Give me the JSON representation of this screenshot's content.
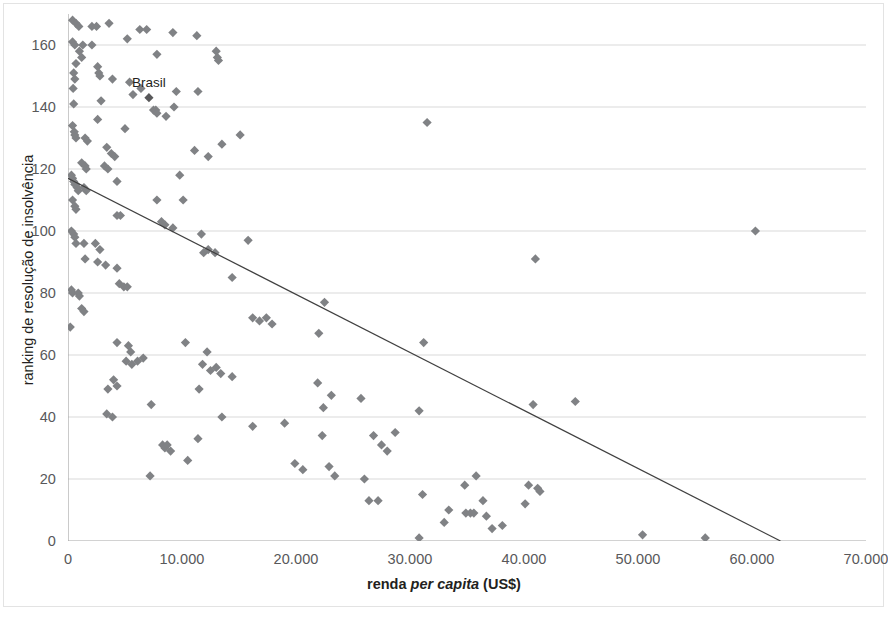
{
  "chart_data": {
    "type": "scatter",
    "title": "",
    "xlabel_parts": {
      "pre": "renda ",
      "italic": "per capita",
      "post": " (US$)"
    },
    "xlabel": "renda per capita (US$)",
    "ylabel": "ranking de resolução de insolvência",
    "xlim": [
      0,
      70000
    ],
    "ylim": [
      0,
      170
    ],
    "x_ticks": [
      0,
      10000,
      20000,
      30000,
      40000,
      50000,
      60000,
      70000
    ],
    "x_tick_labels": [
      "0",
      "10.000",
      "20.000",
      "30.000",
      "40.000",
      "50.000",
      "60.000",
      "70.000"
    ],
    "y_ticks": [
      0,
      20,
      40,
      60,
      80,
      100,
      120,
      140,
      160
    ],
    "y_tick_labels": [
      "0",
      "20",
      "40",
      "60",
      "80",
      "100",
      "120",
      "140",
      "160"
    ],
    "grid": "horizontal",
    "legend": "none",
    "marker": {
      "shape": "diamond",
      "size": 8,
      "color": "#808285"
    },
    "highlight_marker": {
      "color": "#58585a"
    },
    "trendline": {
      "type": "linear",
      "color": "#404040",
      "width": 1.2,
      "x_start": 0,
      "y_start": 117,
      "x_end": 62500,
      "y_end": 0
    },
    "annotations": [
      {
        "label": "Brasil",
        "x": 7100,
        "y": 143
      }
    ],
    "points": [
      {
        "x": 400,
        "y": 168
      },
      {
        "x": 700,
        "y": 167
      },
      {
        "x": 950,
        "y": 166
      },
      {
        "x": 2100,
        "y": 166
      },
      {
        "x": 2500,
        "y": 166
      },
      {
        "x": 3600,
        "y": 167
      },
      {
        "x": 6300,
        "y": 165
      },
      {
        "x": 6900,
        "y": 165
      },
      {
        "x": 9200,
        "y": 164
      },
      {
        "x": 400,
        "y": 161
      },
      {
        "x": 600,
        "y": 160
      },
      {
        "x": 1300,
        "y": 160
      },
      {
        "x": 2100,
        "y": 160
      },
      {
        "x": 5200,
        "y": 162
      },
      {
        "x": 11300,
        "y": 163
      },
      {
        "x": 1000,
        "y": 158
      },
      {
        "x": 1200,
        "y": 156
      },
      {
        "x": 7800,
        "y": 157
      },
      {
        "x": 13000,
        "y": 158
      },
      {
        "x": 13100,
        "y": 156
      },
      {
        "x": 13200,
        "y": 155
      },
      {
        "x": 700,
        "y": 154
      },
      {
        "x": 2600,
        "y": 153
      },
      {
        "x": 2700,
        "y": 151
      },
      {
        "x": 2800,
        "y": 150
      },
      {
        "x": 500,
        "y": 151
      },
      {
        "x": 600,
        "y": 149
      },
      {
        "x": 3900,
        "y": 149
      },
      {
        "x": 5400,
        "y": 148
      },
      {
        "x": 450,
        "y": 146
      },
      {
        "x": 6400,
        "y": 146
      },
      {
        "x": 7100,
        "y": 143,
        "highlight": true
      },
      {
        "x": 11400,
        "y": 145
      },
      {
        "x": 9500,
        "y": 145
      },
      {
        "x": 500,
        "y": 141
      },
      {
        "x": 2900,
        "y": 142
      },
      {
        "x": 5700,
        "y": 144
      },
      {
        "x": 7500,
        "y": 139
      },
      {
        "x": 7700,
        "y": 139
      },
      {
        "x": 7800,
        "y": 138
      },
      {
        "x": 9300,
        "y": 140
      },
      {
        "x": 8600,
        "y": 137
      },
      {
        "x": 2600,
        "y": 136
      },
      {
        "x": 400,
        "y": 134
      },
      {
        "x": 550,
        "y": 132
      },
      {
        "x": 600,
        "y": 131
      },
      {
        "x": 700,
        "y": 130
      },
      {
        "x": 1500,
        "y": 130
      },
      {
        "x": 1700,
        "y": 129
      },
      {
        "x": 5000,
        "y": 133
      },
      {
        "x": 11100,
        "y": 126
      },
      {
        "x": 12300,
        "y": 124
      },
      {
        "x": 13500,
        "y": 128
      },
      {
        "x": 15100,
        "y": 131
      },
      {
        "x": 3400,
        "y": 127
      },
      {
        "x": 3800,
        "y": 125
      },
      {
        "x": 4100,
        "y": 124
      },
      {
        "x": 1200,
        "y": 122
      },
      {
        "x": 1500,
        "y": 121
      },
      {
        "x": 1600,
        "y": 120
      },
      {
        "x": 3200,
        "y": 121
      },
      {
        "x": 3500,
        "y": 120
      },
      {
        "x": 9800,
        "y": 118
      },
      {
        "x": 300,
        "y": 118
      },
      {
        "x": 400,
        "y": 117
      },
      {
        "x": 500,
        "y": 116
      },
      {
        "x": 600,
        "y": 115
      },
      {
        "x": 700,
        "y": 115
      },
      {
        "x": 800,
        "y": 114
      },
      {
        "x": 900,
        "y": 113
      },
      {
        "x": 1400,
        "y": 114
      },
      {
        "x": 1600,
        "y": 113
      },
      {
        "x": 4300,
        "y": 116
      },
      {
        "x": 7800,
        "y": 110
      },
      {
        "x": 10100,
        "y": 110
      },
      {
        "x": 400,
        "y": 110
      },
      {
        "x": 600,
        "y": 108
      },
      {
        "x": 700,
        "y": 107
      },
      {
        "x": 4300,
        "y": 105
      },
      {
        "x": 4600,
        "y": 105
      },
      {
        "x": 8200,
        "y": 103
      },
      {
        "x": 8500,
        "y": 102
      },
      {
        "x": 9200,
        "y": 101
      },
      {
        "x": 300,
        "y": 100
      },
      {
        "x": 500,
        "y": 99
      },
      {
        "x": 600,
        "y": 98
      },
      {
        "x": 700,
        "y": 96
      },
      {
        "x": 1400,
        "y": 96
      },
      {
        "x": 2400,
        "y": 96
      },
      {
        "x": 2800,
        "y": 94
      },
      {
        "x": 11700,
        "y": 99
      },
      {
        "x": 12300,
        "y": 94
      },
      {
        "x": 12900,
        "y": 93
      },
      {
        "x": 15800,
        "y": 97
      },
      {
        "x": 11900,
        "y": 93
      },
      {
        "x": 41000,
        "y": 91
      },
      {
        "x": 60300,
        "y": 100
      },
      {
        "x": 1500,
        "y": 91
      },
      {
        "x": 2600,
        "y": 90
      },
      {
        "x": 3300,
        "y": 89
      },
      {
        "x": 4300,
        "y": 88
      },
      {
        "x": 14400,
        "y": 85
      },
      {
        "x": 22500,
        "y": 77
      },
      {
        "x": 300,
        "y": 81
      },
      {
        "x": 400,
        "y": 80
      },
      {
        "x": 900,
        "y": 80
      },
      {
        "x": 1000,
        "y": 79
      },
      {
        "x": 4500,
        "y": 83
      },
      {
        "x": 4900,
        "y": 82
      },
      {
        "x": 5200,
        "y": 82
      },
      {
        "x": 1200,
        "y": 75
      },
      {
        "x": 1400,
        "y": 74
      },
      {
        "x": 16200,
        "y": 72
      },
      {
        "x": 16800,
        "y": 71
      },
      {
        "x": 17400,
        "y": 72
      },
      {
        "x": 17900,
        "y": 70
      },
      {
        "x": 200,
        "y": 69
      },
      {
        "x": 22000,
        "y": 67
      },
      {
        "x": 31200,
        "y": 64
      },
      {
        "x": 31500,
        "y": 135
      },
      {
        "x": 4300,
        "y": 64
      },
      {
        "x": 5300,
        "y": 63
      },
      {
        "x": 5500,
        "y": 61
      },
      {
        "x": 10300,
        "y": 64
      },
      {
        "x": 12200,
        "y": 61
      },
      {
        "x": 11800,
        "y": 57
      },
      {
        "x": 12500,
        "y": 55
      },
      {
        "x": 13000,
        "y": 56
      },
      {
        "x": 13400,
        "y": 54
      },
      {
        "x": 14400,
        "y": 53
      },
      {
        "x": 5100,
        "y": 58
      },
      {
        "x": 5600,
        "y": 57
      },
      {
        "x": 6100,
        "y": 58
      },
      {
        "x": 6600,
        "y": 59
      },
      {
        "x": 4000,
        "y": 52
      },
      {
        "x": 4300,
        "y": 50
      },
      {
        "x": 3500,
        "y": 49
      },
      {
        "x": 11500,
        "y": 49
      },
      {
        "x": 21900,
        "y": 51
      },
      {
        "x": 23100,
        "y": 47
      },
      {
        "x": 22400,
        "y": 43
      },
      {
        "x": 25700,
        "y": 46
      },
      {
        "x": 30800,
        "y": 42
      },
      {
        "x": 40800,
        "y": 44
      },
      {
        "x": 44500,
        "y": 45
      },
      {
        "x": 3400,
        "y": 41
      },
      {
        "x": 3900,
        "y": 40
      },
      {
        "x": 7300,
        "y": 44
      },
      {
        "x": 13500,
        "y": 40
      },
      {
        "x": 11400,
        "y": 33
      },
      {
        "x": 16200,
        "y": 37
      },
      {
        "x": 19000,
        "y": 38
      },
      {
        "x": 22300,
        "y": 34
      },
      {
        "x": 26800,
        "y": 34
      },
      {
        "x": 28700,
        "y": 35
      },
      {
        "x": 27500,
        "y": 31
      },
      {
        "x": 28000,
        "y": 29
      },
      {
        "x": 8300,
        "y": 31
      },
      {
        "x": 8500,
        "y": 30
      },
      {
        "x": 8700,
        "y": 31
      },
      {
        "x": 9000,
        "y": 29
      },
      {
        "x": 10500,
        "y": 26
      },
      {
        "x": 19900,
        "y": 25
      },
      {
        "x": 20600,
        "y": 23
      },
      {
        "x": 22900,
        "y": 24
      },
      {
        "x": 7200,
        "y": 21
      },
      {
        "x": 23400,
        "y": 21
      },
      {
        "x": 26000,
        "y": 20
      },
      {
        "x": 34800,
        "y": 18
      },
      {
        "x": 35800,
        "y": 21
      },
      {
        "x": 40400,
        "y": 18
      },
      {
        "x": 41200,
        "y": 17
      },
      {
        "x": 41400,
        "y": 16
      },
      {
        "x": 26400,
        "y": 13
      },
      {
        "x": 27200,
        "y": 13
      },
      {
        "x": 31100,
        "y": 15
      },
      {
        "x": 36400,
        "y": 13
      },
      {
        "x": 40100,
        "y": 12
      },
      {
        "x": 33400,
        "y": 10
      },
      {
        "x": 34900,
        "y": 9
      },
      {
        "x": 35300,
        "y": 9
      },
      {
        "x": 35600,
        "y": 9
      },
      {
        "x": 36700,
        "y": 8
      },
      {
        "x": 33000,
        "y": 6
      },
      {
        "x": 38100,
        "y": 5
      },
      {
        "x": 37200,
        "y": 4
      },
      {
        "x": 30800,
        "y": 1
      },
      {
        "x": 50400,
        "y": 2
      },
      {
        "x": 55900,
        "y": 1
      }
    ]
  }
}
